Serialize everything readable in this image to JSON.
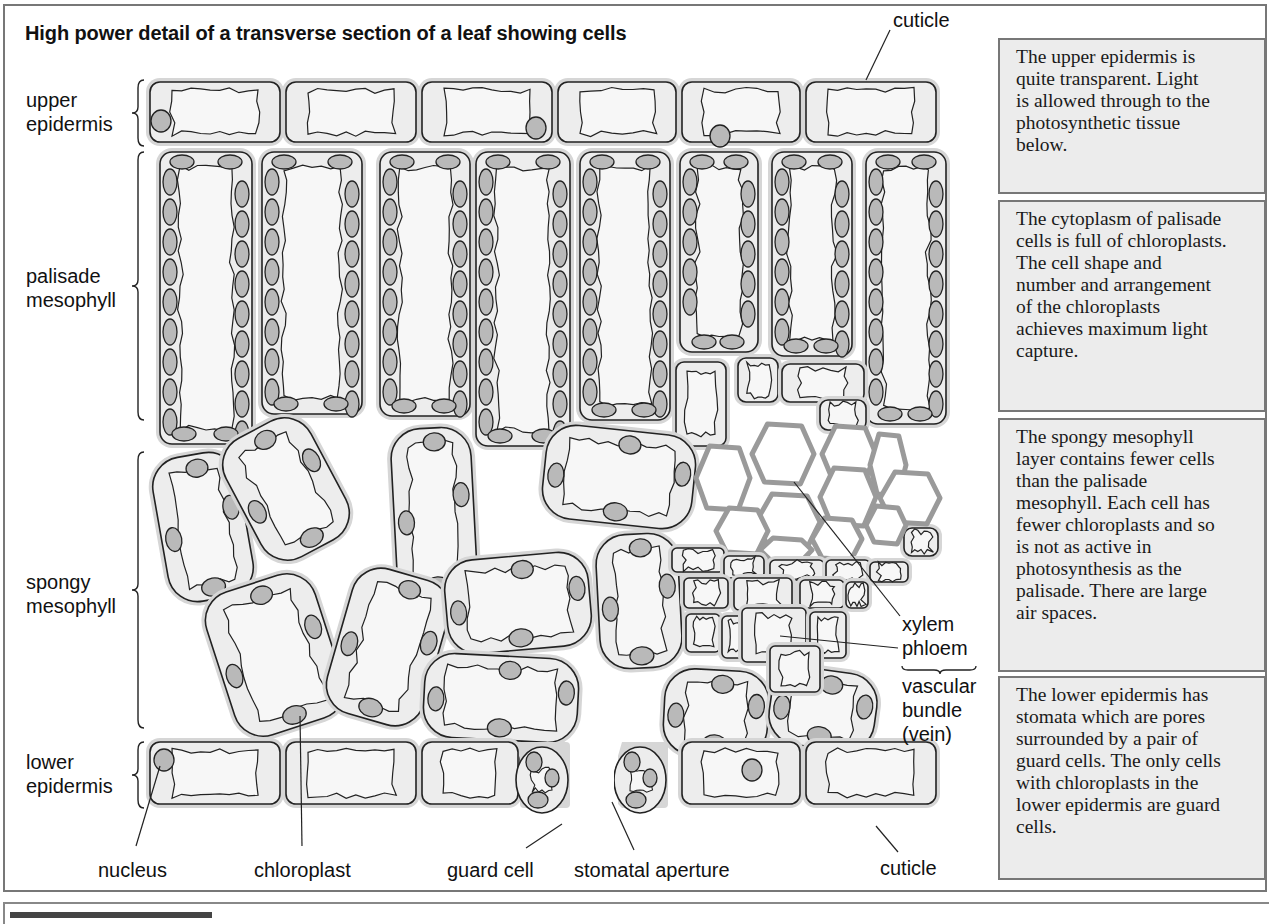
{
  "title": "High power detail of a transverse section of a leaf showing cells",
  "colors": {
    "cell_wall": "#d6d6d6",
    "cytoplasm": "#ededed",
    "vacuole": "#f7f7f7",
    "chloroplast": "#b9b9b9",
    "outline": "#222222",
    "xylem_wall": "#9a9a9a",
    "note_bg": "#ececec",
    "note_border": "#777777"
  },
  "layer_labels": {
    "upper_epidermis": [
      "upper",
      "epidermis"
    ],
    "palisade_mesophyll": [
      "palisade",
      "mesophyll"
    ],
    "spongy_mesophyll": [
      "spongy",
      "mesophyll"
    ],
    "lower_epidermis": [
      "lower",
      "epidermis"
    ]
  },
  "callouts": {
    "cuticle_top": "cuticle",
    "xylem": "xylem",
    "phloem": "phloem",
    "vascular_bundle": [
      "vascular",
      "bundle",
      "(vein)"
    ],
    "nucleus": "nucleus",
    "chloroplast": "chloroplast",
    "guard_cell": "guard cell",
    "stomatal_aperture": "stomatal aperture",
    "cuticle_bottom": "cuticle"
  },
  "notes": [
    {
      "id": "upper",
      "lines": [
        "The upper epidermis is",
        "quite transparent. Light",
        "is allowed through to the",
        "photosynthetic tissue",
        "below."
      ]
    },
    {
      "id": "palisade",
      "lines": [
        "The cytoplasm of palisade",
        "cells is full of chloroplasts.",
        "The cell shape and",
        "number and arrangement",
        "of the chloroplasts",
        "achieves maximum light",
        "capture."
      ]
    },
    {
      "id": "spongy",
      "lines": [
        "The spongy mesophyll",
        "layer contains fewer cells",
        "than the palisade",
        "mesophyll. Each cell has",
        "fewer chloroplasts and so",
        "is not as active in",
        "photosynthesis as the",
        "palisade. There are large",
        "air spaces."
      ]
    },
    {
      "id": "lower",
      "lines": [
        "The lower epidermis has",
        "stomata which are pores",
        "surrounded by a pair of",
        "guard cells. The only cells",
        "with chloroplasts in the",
        "lower epidermis are guard",
        "cells."
      ]
    }
  ],
  "geometry": {
    "upper_epidermis": [
      [
        150,
        82,
        130,
        60
      ],
      [
        286,
        82,
        130,
        60
      ],
      [
        422,
        82,
        130,
        60
      ],
      [
        558,
        82,
        118,
        60
      ],
      [
        682,
        82,
        118,
        60
      ],
      [
        806,
        82,
        130,
        60
      ]
    ],
    "upper_nuclei": [
      [
        161,
        121
      ],
      [
        536,
        128
      ],
      [
        720,
        136
      ]
    ],
    "palisade": [
      [
        160,
        152,
        92,
        292
      ],
      [
        262,
        152,
        100,
        262
      ],
      [
        380,
        152,
        90,
        264
      ],
      [
        476,
        152,
        94,
        294
      ],
      [
        580,
        152,
        90,
        268
      ],
      [
        680,
        152,
        78,
        200
      ],
      [
        772,
        152,
        80,
        204
      ],
      [
        866,
        152,
        80,
        272
      ]
    ],
    "small_cells": [
      [
        676,
        362,
        50,
        84
      ],
      [
        738,
        358,
        40,
        44
      ],
      [
        782,
        364,
        82,
        38
      ],
      [
        820,
        400,
        46,
        30
      ],
      [
        904,
        528,
        34,
        28
      ]
    ],
    "spongy": [
      [
        160,
        454,
        86,
        146,
        -10
      ],
      [
        238,
        422,
        96,
        134,
        -28
      ],
      [
        394,
        428,
        80,
        170,
        -3
      ],
      [
        544,
        430,
        150,
        94,
        6
      ],
      [
        218,
        580,
        114,
        150,
        -18
      ],
      [
        338,
        572,
        100,
        150,
        16
      ],
      [
        446,
        556,
        144,
        94,
        -5
      ],
      [
        424,
        656,
        154,
        84,
        3
      ],
      [
        598,
        534,
        82,
        134,
        -3
      ],
      [
        664,
        670,
        104,
        86,
        3
      ],
      [
        770,
        670,
        106,
        78,
        8
      ]
    ],
    "xylem": [
      [
        696,
        446,
        54,
        64
      ],
      [
        752,
        424,
        62,
        60
      ],
      [
        822,
        426,
        54,
        56
      ],
      [
        870,
        434,
        36,
        62
      ],
      [
        756,
        494,
        64,
        56
      ],
      [
        820,
        468,
        56,
        58
      ],
      [
        880,
        472,
        60,
        52
      ],
      [
        716,
        508,
        52,
        46
      ],
      [
        866,
        506,
        40,
        38
      ],
      [
        812,
        518,
        50,
        42
      ],
      [
        760,
        538,
        52,
        24
      ]
    ],
    "phloem": [
      [
        672,
        548,
        52,
        24
      ],
      [
        724,
        556,
        40,
        22
      ],
      [
        770,
        560,
        54,
        20
      ],
      [
        826,
        560,
        44,
        22
      ],
      [
        870,
        562,
        38,
        20
      ],
      [
        684,
        578,
        44,
        30
      ],
      [
        734,
        578,
        58,
        32
      ],
      [
        800,
        580,
        44,
        28
      ],
      [
        846,
        582,
        22,
        26
      ],
      [
        686,
        614,
        34,
        38
      ],
      [
        722,
        616,
        28,
        42
      ],
      [
        742,
        608,
        64,
        54
      ],
      [
        810,
        612,
        36,
        46
      ],
      [
        770,
        646,
        50,
        46
      ]
    ],
    "lower_epidermis": [
      [
        150,
        742,
        130,
        62
      ],
      [
        286,
        742,
        130,
        62
      ],
      [
        422,
        742,
        96,
        62
      ],
      [
        682,
        742,
        118,
        62
      ],
      [
        806,
        742,
        130,
        62
      ]
    ],
    "guard_cells": [
      [
        542,
        780,
        26,
        33
      ],
      [
        640,
        780,
        26,
        33
      ]
    ],
    "lower_nuclei": [
      [
        164,
        760
      ],
      [
        530,
        760
      ],
      [
        752,
        770
      ]
    ]
  }
}
